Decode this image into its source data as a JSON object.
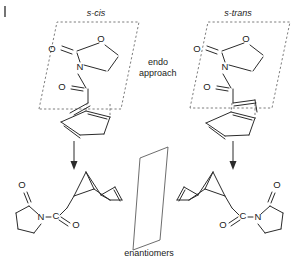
{
  "figure": {
    "type": "chemical-reaction-scheme",
    "corner_mark": "|"
  },
  "labels": {
    "s_cis": "s-cis",
    "s_trans": "s-trans",
    "endo_line1": "endo",
    "endo_line2": "approach",
    "enantiomers": "enantiomers"
  },
  "atoms": {
    "oxygen": "O",
    "nitrogen": "N",
    "carbon": "C"
  },
  "left_reactant": {
    "conformer": "s-cis",
    "ring": "oxazolidin-2-one",
    "atom_labels": [
      "O",
      "O",
      "N",
      "O"
    ],
    "diene": "cyclopentadiene"
  },
  "right_reactant": {
    "conformer": "s-trans",
    "ring": "oxazolidin-2-one",
    "atom_labels": [
      "O",
      "O",
      "N",
      "O"
    ],
    "diene": "cyclopentadiene"
  },
  "left_product": {
    "core": "bicyclo[2.2.1]hept-2-ene",
    "auxiliary": "pyrrolidin-2-one",
    "atom_labels": [
      "O",
      "N",
      "C",
      "O"
    ]
  },
  "right_product": {
    "core": "bicyclo[2.2.1]hept-2-ene",
    "auxiliary": "pyrrolidin-2-one",
    "atom_labels": [
      "O",
      "C",
      "N",
      "O"
    ]
  },
  "colors": {
    "line": "#2b2b2b",
    "dashed_plane": "#6e6e6e",
    "mirror_plane": "#5c5c5c",
    "text": "#1a1a1a",
    "background": "#ffffff"
  }
}
